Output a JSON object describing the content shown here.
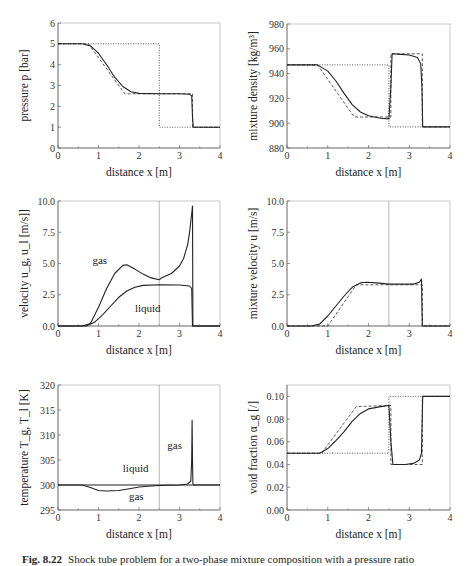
{
  "caption": {
    "fig": "Fig. 8.22",
    "text": "Shock tube problem for a two-phase mixture composition with a pressure ratio"
  },
  "chart_data": [
    {
      "type": "line",
      "id": "pressure",
      "xlabel": "distance x [m]",
      "ylabel": "pressure p [bar]",
      "xlim": [
        0,
        4
      ],
      "ylim": [
        0,
        6
      ],
      "xticks": [
        "0",
        "1",
        "2",
        "3",
        "4"
      ],
      "yticks": [
        "0",
        "1",
        "2",
        "3",
        "4",
        "5",
        "6"
      ],
      "frame": {
        "x0": 58,
        "x1": 220,
        "y0": 23,
        "y1": 148
      },
      "series": [
        {
          "name": "initial",
          "style": "dotted",
          "x": [
            0,
            2.5,
            2.5,
            4
          ],
          "y": [
            5,
            5,
            1,
            1
          ]
        },
        {
          "name": "exact",
          "style": "dashed",
          "x": [
            0,
            0.75,
            1.65,
            3.32,
            3.32,
            4
          ],
          "y": [
            5,
            5,
            2.6,
            2.6,
            1,
            1
          ]
        },
        {
          "name": "numerical",
          "style": "solid",
          "x": [
            0,
            0.6,
            0.8,
            1.0,
            1.2,
            1.4,
            1.6,
            1.8,
            2.0,
            2.5,
            3.0,
            3.25,
            3.3,
            3.32,
            3.34,
            4
          ],
          "y": [
            5,
            5,
            4.9,
            4.55,
            4.0,
            3.4,
            2.95,
            2.7,
            2.62,
            2.6,
            2.6,
            2.58,
            2.5,
            1.5,
            1,
            1
          ]
        }
      ]
    },
    {
      "type": "line",
      "id": "density",
      "xlabel": "distance x [m]",
      "ylabel": "mixture density [kg/m³]",
      "xlim": [
        0,
        4
      ],
      "ylim": [
        880,
        980
      ],
      "xticks": [
        "0",
        "1",
        "2",
        "3",
        "4"
      ],
      "yticks": [
        "880",
        "900",
        "920",
        "940",
        "960",
        "980"
      ],
      "frame": {
        "x0": 287,
        "x1": 450,
        "y0": 24,
        "y1": 148
      },
      "series": [
        {
          "name": "initial",
          "style": "dotted",
          "x": [
            0,
            2.5,
            2.5,
            4
          ],
          "y": [
            947,
            947,
            897,
            897
          ]
        },
        {
          "name": "exact",
          "style": "dashed",
          "x": [
            0,
            0.75,
            1.65,
            2.5,
            2.55,
            2.55,
            3.32,
            3.32,
            4
          ],
          "y": [
            947,
            947,
            905,
            905,
            905,
            956,
            956,
            897,
            897
          ]
        },
        {
          "name": "numerical",
          "style": "solid",
          "x": [
            0,
            0.75,
            1.0,
            1.2,
            1.4,
            1.6,
            1.8,
            2.0,
            2.3,
            2.5,
            2.55,
            2.58,
            2.8,
            3.0,
            3.2,
            3.28,
            3.31,
            3.33,
            4
          ],
          "y": [
            947,
            947,
            942,
            934,
            924,
            915,
            909,
            906,
            904,
            903.5,
            930,
            956,
            955.5,
            955,
            953,
            948,
            930,
            897,
            897
          ]
        }
      ]
    },
    {
      "type": "line",
      "id": "phase-velocity",
      "xlabel": "distance x [m]",
      "ylabel": "velocity u_g, u_l [m/s]]",
      "xlim": [
        0,
        4
      ],
      "ylim": [
        0,
        10
      ],
      "xticks": [
        "0",
        "1",
        "2",
        "3",
        "4"
      ],
      "yticks": [
        "0.0",
        "2.5",
        "5.0",
        "7.5",
        "10.0"
      ],
      "frame": {
        "x0": 58,
        "x1": 220,
        "y0": 201,
        "y1": 326
      },
      "annotations": [
        {
          "text": "gas",
          "x": 0.85,
          "y": 5.0
        },
        {
          "text": "liquid",
          "x": 1.9,
          "y": 1.1
        }
      ],
      "vline": 2.5,
      "series": [
        {
          "name": "gas",
          "style": "solid",
          "x": [
            0,
            0.6,
            0.8,
            1.0,
            1.2,
            1.4,
            1.6,
            1.7,
            1.9,
            2.1,
            2.3,
            2.5,
            2.55,
            2.8,
            3.0,
            3.1,
            3.2,
            3.25,
            3.3,
            3.32,
            3.33,
            4
          ],
          "y": [
            0,
            0,
            0.2,
            1.5,
            3.0,
            4.2,
            4.85,
            4.9,
            4.55,
            4.15,
            3.85,
            3.7,
            3.85,
            4.2,
            4.8,
            5.4,
            6.5,
            7.5,
            9.0,
            9.6,
            0,
            0
          ]
        },
        {
          "name": "liquid",
          "style": "solid",
          "x": [
            0,
            0.7,
            0.9,
            1.1,
            1.3,
            1.5,
            1.7,
            1.9,
            2.1,
            2.5,
            3.0,
            3.25,
            3.3,
            3.32,
            4
          ],
          "y": [
            0,
            0,
            0.3,
            0.9,
            1.6,
            2.3,
            2.8,
            3.1,
            3.25,
            3.3,
            3.28,
            3.2,
            3.0,
            0,
            0
          ]
        }
      ]
    },
    {
      "type": "line",
      "id": "mixture-velocity",
      "xlabel": "distance x [m]",
      "ylabel": "mixture velocity u [m/s]",
      "xlim": [
        0,
        4
      ],
      "ylim": [
        0,
        10
      ],
      "xticks": [
        "0",
        "1",
        "2",
        "3",
        "4"
      ],
      "yticks": [
        "0.0",
        "2.5",
        "5.0",
        "7.5",
        "10.0"
      ],
      "frame": {
        "x0": 287,
        "x1": 450,
        "y0": 201,
        "y1": 326
      },
      "vline": 2.5,
      "series": [
        {
          "name": "exact",
          "style": "dashed",
          "x": [
            0,
            1.0,
            1.7,
            3.32,
            3.32,
            4
          ],
          "y": [
            0,
            0,
            3.3,
            3.3,
            0,
            0
          ]
        },
        {
          "name": "numerical",
          "style": "solid",
          "x": [
            0,
            0.6,
            0.8,
            1.0,
            1.2,
            1.4,
            1.6,
            1.8,
            1.95,
            2.2,
            2.5,
            2.8,
            3.1,
            3.25,
            3.3,
            3.32,
            4
          ],
          "y": [
            0,
            0,
            0.15,
            0.8,
            1.6,
            2.4,
            3.1,
            3.45,
            3.5,
            3.45,
            3.35,
            3.35,
            3.35,
            3.5,
            3.75,
            0,
            0
          ]
        }
      ]
    },
    {
      "type": "line",
      "id": "temperature",
      "xlabel": "distance x [m]",
      "ylabel": "temperature T_g, T_l [K]",
      "xlim": [
        0,
        4
      ],
      "ylim": [
        295,
        320
      ],
      "xticks": [
        "0",
        "1",
        "2",
        "3",
        "4"
      ],
      "yticks": [
        "295",
        "300",
        "305",
        "310",
        "315",
        "320"
      ],
      "frame": {
        "x0": 58,
        "x1": 220,
        "y0": 385,
        "y1": 510
      },
      "annotations": [
        {
          "text": "liquid",
          "x": 1.6,
          "y": 302.7
        },
        {
          "text": "gas",
          "x": 1.75,
          "y": 297.0
        },
        {
          "text": "gas",
          "x": 2.7,
          "y": 307.3
        }
      ],
      "vline": 2.5,
      "series": [
        {
          "name": "liquid",
          "style": "solid",
          "x": [
            0,
            4
          ],
          "y": [
            300,
            300
          ]
        },
        {
          "name": "gas",
          "style": "solid",
          "x": [
            0,
            0.6,
            0.8,
            1.0,
            1.2,
            1.5,
            1.8,
            2.0,
            2.3,
            2.5,
            3.0,
            3.2,
            3.28,
            3.3,
            3.31,
            3.32,
            3.33,
            3.35,
            4
          ],
          "y": [
            300,
            300,
            299.5,
            298.9,
            298.8,
            298.9,
            299.3,
            299.6,
            299.8,
            299.9,
            300,
            300.2,
            300.8,
            305,
            313,
            305,
            300.3,
            300,
            300
          ]
        }
      ]
    },
    {
      "type": "line",
      "id": "void-fraction",
      "xlabel": "distance x [m]",
      "ylabel": "void fraction α_g [/]",
      "xlim": [
        0,
        4
      ],
      "ylim": [
        0,
        0.11
      ],
      "xticks": [
        "0",
        "1",
        "2",
        "3",
        "4"
      ],
      "yticks": [
        "0.00",
        "0.02",
        "0.04",
        "0.06",
        "0.08",
        "0.10"
      ],
      "frame": {
        "x0": 287,
        "x1": 450,
        "y0": 385,
        "y1": 510
      },
      "series": [
        {
          "name": "initial",
          "style": "dotted",
          "x": [
            0,
            2.5,
            2.5,
            4
          ],
          "y": [
            0.05,
            0.05,
            0.1,
            0.1
          ]
        },
        {
          "name": "exact",
          "style": "dashed",
          "x": [
            0,
            0.85,
            1.7,
            2.5,
            2.55,
            2.55,
            3.32,
            3.32,
            4
          ],
          "y": [
            0.05,
            0.05,
            0.091,
            0.092,
            0.092,
            0.04,
            0.04,
            0.1,
            0.1
          ]
        },
        {
          "name": "numerical",
          "style": "solid",
          "x": [
            0,
            0.8,
            1.0,
            1.2,
            1.4,
            1.6,
            1.8,
            2.0,
            2.3,
            2.5,
            2.55,
            2.6,
            2.9,
            3.1,
            3.25,
            3.3,
            3.33,
            4
          ],
          "y": [
            0.05,
            0.05,
            0.054,
            0.061,
            0.069,
            0.078,
            0.085,
            0.089,
            0.091,
            0.092,
            0.06,
            0.04,
            0.04,
            0.041,
            0.044,
            0.05,
            0.1,
            0.1
          ]
        }
      ]
    }
  ]
}
